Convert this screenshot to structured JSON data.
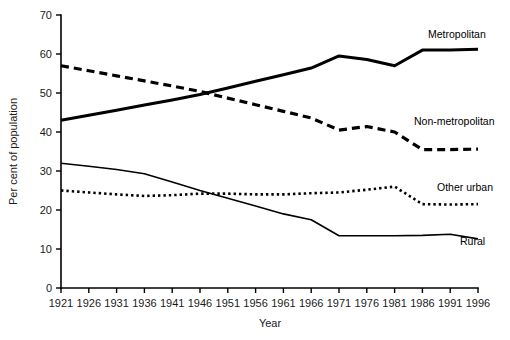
{
  "chart_data": {
    "type": "line",
    "title": "",
    "xlabel": "Year",
    "ylabel": "Per cent of population",
    "xlim": [
      1921,
      1996
    ],
    "ylim": [
      0,
      70
    ],
    "grid": false,
    "legend_position": "inline-right-end-labels",
    "x": [
      1921,
      1926,
      1931,
      1936,
      1941,
      1946,
      1951,
      1956,
      1961,
      1966,
      1971,
      1976,
      1981,
      1986,
      1991,
      1996
    ],
    "xticklabels": [
      "1921",
      "1926",
      "1931",
      "1936",
      "1941",
      "1946",
      "1951",
      "1956",
      "1961",
      "1966",
      "1971",
      "1976",
      "1981",
      "1986",
      "1991",
      "1996"
    ],
    "yticks": [
      0,
      10,
      20,
      30,
      40,
      50,
      60,
      70
    ],
    "yticklabels": [
      "0",
      "10",
      "20",
      "30",
      "40",
      "50",
      "60",
      "70"
    ],
    "series": [
      {
        "name": "Metropolitan",
        "label": "Metropolitan",
        "style": "solid-thick",
        "color": "#000000",
        "values": [
          43.0,
          44.3,
          45.6,
          46.9,
          48.2,
          49.6,
          51.3,
          53.0,
          54.7,
          56.4,
          59.5,
          58.6,
          57.0,
          61.0,
          61.0,
          61.2
        ]
      },
      {
        "name": "Non-metropolitan",
        "label": "Non-metropolitan",
        "style": "dashed-thick",
        "color": "#000000",
        "values": [
          57.0,
          55.7,
          54.4,
          53.1,
          51.8,
          50.4,
          48.7,
          47.0,
          45.3,
          43.6,
          40.5,
          41.4,
          40.0,
          35.5,
          35.5,
          35.6
        ]
      },
      {
        "name": "Other urban",
        "label": "Other urban",
        "style": "dotted",
        "color": "#000000",
        "values": [
          25.0,
          24.5,
          24.0,
          23.6,
          23.8,
          24.2,
          24.2,
          24.0,
          24.0,
          24.3,
          24.5,
          25.2,
          26.0,
          21.5,
          21.4,
          21.5
        ]
      },
      {
        "name": "Rural",
        "label": "Rural",
        "style": "solid-thin",
        "color": "#000000",
        "values": [
          32.0,
          31.2,
          30.4,
          29.3,
          27.2,
          25.0,
          23.0,
          21.0,
          19.0,
          17.5,
          13.4,
          13.4,
          13.4,
          13.5,
          13.8,
          12.6
        ]
      }
    ]
  }
}
